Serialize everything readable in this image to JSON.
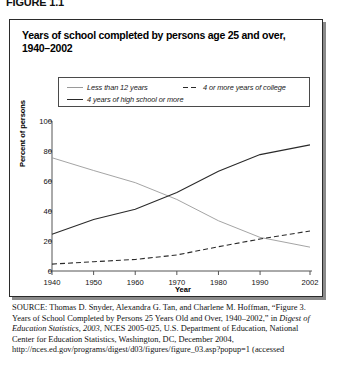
{
  "figure_label": "FIGURE 1.1",
  "chart_title": "Years of school completed by persons age 25 and over, 1940–2002",
  "legend": [
    {
      "label": "Less than 12 years",
      "style": "solid-light"
    },
    {
      "label": "4 or more years of college",
      "style": "dashed"
    },
    {
      "label": "4 years of high school or more",
      "style": "solid-dark"
    }
  ],
  "source": {
    "prefix": "SOURCE",
    "part1": ": Thomas D. Snyder, Alexandra G. Tan, and Charlene M. Hoffman, “Figure 3. Years of School Completed by Persons 25 Years Old and Over, 1940–2002,” in ",
    "italic1": "Digest of Education Statistics, 2003",
    "part2": ", NCES 2005-025, U.S. Department of Education, National Center for Education Statistics, Washington, DC, December 2004, http://nces.ed.gov/programs/digest/d03/figures/figure_03.asp?popup=1 (accessed"
  },
  "chart_data": {
    "type": "line",
    "title": "Years of school completed by persons age 25 and over, 1940–2002",
    "xlabel": "Year",
    "ylabel": "Percent of persons",
    "xlim": [
      1940,
      2002
    ],
    "ylim": [
      0,
      100
    ],
    "yticks": [
      100,
      80,
      60,
      40,
      20,
      0
    ],
    "xticks": [
      1940,
      1950,
      1960,
      1970,
      1980,
      1990,
      2002
    ],
    "grid": false,
    "legend_position": "top",
    "x": [
      1940,
      1950,
      1960,
      1970,
      1980,
      1990,
      2002
    ],
    "series": [
      {
        "name": "Less than 12 years",
        "style": "solid-light",
        "color": "#9a9a9a",
        "values": [
          75.5,
          67.0,
          58.9,
          47.7,
          33.5,
          22.4,
          15.9
        ]
      },
      {
        "name": "4 years of high school or more",
        "style": "solid-dark",
        "color": "#2a2a2a",
        "values": [
          24.5,
          34.3,
          41.1,
          52.3,
          66.5,
          77.6,
          84.1
        ]
      },
      {
        "name": "4 or more years of college",
        "style": "dashed",
        "color": "#2a2a2a",
        "values": [
          4.6,
          6.2,
          7.7,
          10.7,
          16.2,
          21.3,
          26.7
        ]
      }
    ]
  }
}
